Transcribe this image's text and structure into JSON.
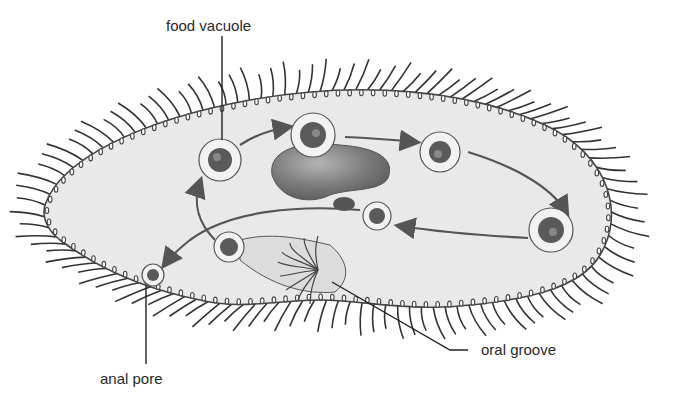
{
  "diagram": {
    "labels": {
      "food_vacuole": "food vacuole",
      "anal_pore": "anal pore",
      "oral_groove": "oral groove"
    },
    "colors": {
      "background": "#ffffff",
      "cell_fill": "#e9e9e9",
      "cilia": "#333333",
      "arrow": "#555555",
      "nucleus": "#7a7a7a",
      "text": "#2a2a2a"
    }
  }
}
